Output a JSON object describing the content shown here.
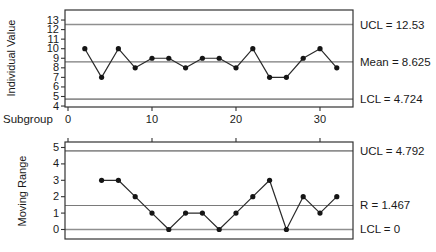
{
  "figure": {
    "background": "#ffffff",
    "frame_color": "#333333",
    "limit_line_color": "#8f8f8f",
    "center_line_color": "#7a7a7a",
    "series_line_color": "#2a2a2a",
    "marker_color": "#151515",
    "text_color": "#1a1a1a"
  },
  "chart_data": [
    {
      "type": "line",
      "name": "individuals-chart",
      "ylabel": "Individual Value",
      "xlabel": "Subgroup",
      "x": [
        2,
        4,
        6,
        8,
        10,
        12,
        14,
        16,
        18,
        20,
        22,
        24,
        26,
        28,
        30,
        32
      ],
      "values": [
        10,
        7,
        10,
        8,
        9,
        9,
        8,
        9,
        9,
        8,
        10,
        7,
        7,
        9,
        10,
        8
      ],
      "yticks": [
        4,
        5,
        6,
        7,
        8,
        9,
        10,
        11,
        12,
        13
      ],
      "xticks": [
        0,
        10,
        20,
        30
      ],
      "ylim": [
        3.9,
        14.05
      ],
      "xlim": [
        -0.357,
        33.93
      ],
      "grid": "off",
      "lines": [
        {
          "name": "UCL",
          "value": 12.53,
          "label": "UCL = 12.53",
          "style": "limit"
        },
        {
          "name": "Mean",
          "value": 8.625,
          "label": "Mean = 8.625",
          "style": "center"
        },
        {
          "name": "LCL",
          "value": 4.724,
          "label": "LCL = 4.724",
          "style": "limit"
        }
      ]
    },
    {
      "type": "line",
      "name": "moving-range-chart",
      "ylabel": "Moving Range",
      "xlabel": "",
      "x": [
        4,
        6,
        8,
        10,
        12,
        14,
        16,
        18,
        20,
        22,
        24,
        26,
        28,
        30,
        32
      ],
      "values": [
        3,
        3,
        2,
        1,
        0,
        1,
        1,
        0,
        1,
        2,
        3,
        0,
        2,
        1,
        2
      ],
      "yticks": [
        0,
        1,
        2,
        3,
        4,
        5
      ],
      "xticks": [
        0,
        10,
        20,
        30
      ],
      "ylim": [
        -0.58,
        5.335
      ],
      "xlim": [
        -0.357,
        33.93
      ],
      "grid": "off",
      "lines": [
        {
          "name": "UCL",
          "value": 4.792,
          "label": "UCL = 4.792",
          "style": "limit"
        },
        {
          "name": "R",
          "value": 1.467,
          "label": "R = 1.467",
          "style": "center"
        },
        {
          "name": "LCL",
          "value": 0,
          "label": "LCL = 0",
          "style": "limit"
        }
      ]
    }
  ]
}
